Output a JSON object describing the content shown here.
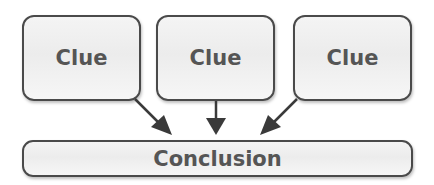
{
  "diagram": {
    "clues": [
      {
        "label": "Clue"
      },
      {
        "label": "Clue"
      },
      {
        "label": "Clue"
      }
    ],
    "conclusion": {
      "label": "Conclusion"
    },
    "colors": {
      "border": "#4a4a4a",
      "text": "#555555",
      "fill": "#eeeeee",
      "arrow": "#3a3a3a"
    }
  }
}
